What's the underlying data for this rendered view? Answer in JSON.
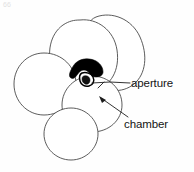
{
  "figure": {
    "kind": "scientific-line-drawing",
    "corner_mark": "66",
    "background_color": "#ffffff",
    "outline_color": "#4a4a4a",
    "aperture_fill_color": "#000000",
    "label_text_color": "#141414",
    "width": 194,
    "height": 172
  },
  "labels": [
    {
      "id": "aperture",
      "text": "aperture",
      "x": 131,
      "y": 78,
      "leader_from_x": 129,
      "leader_from_y": 83,
      "leader_to_x": 93,
      "leader_to_y": 81
    },
    {
      "id": "chamber",
      "text": "chamber",
      "x": 124,
      "y": 119,
      "leader_from_x": 126,
      "leader_from_y": 117,
      "leader_to_x": 100,
      "leader_to_y": 98
    }
  ],
  "chambers": [
    {
      "id": "chamber-upper-right",
      "cx": 110,
      "cy": 52,
      "rx": 32,
      "ry": 36,
      "rotation": -8
    },
    {
      "id": "chamber-upper-left",
      "cx": 83,
      "cy": 55,
      "rx": 33,
      "ry": 35,
      "rotation": 4
    },
    {
      "id": "chamber-left",
      "cx": 45,
      "cy": 83,
      "rx": 29,
      "ry": 30,
      "rotation": 0
    },
    {
      "id": "chamber-lower-right",
      "cx": 92,
      "cy": 104,
      "rx": 30,
      "ry": 28,
      "rotation": 0
    },
    {
      "id": "chamber-bottom",
      "cx": 71,
      "cy": 134,
      "rx": 27,
      "ry": 26,
      "rotation": 0
    }
  ],
  "aperture": {
    "id": "aperture-structure",
    "description": "black trapezoidal lip with small opening beneath",
    "center_x": 84,
    "center_y": 71,
    "hole_x": 87,
    "hole_y": 82
  }
}
